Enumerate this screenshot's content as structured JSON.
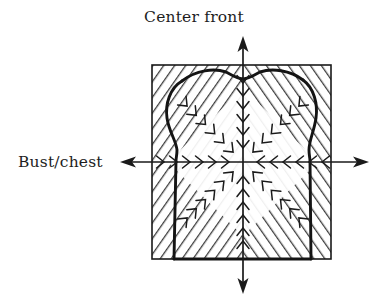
{
  "figure": {
    "type": "technical-illustration",
    "background_color": "#ffffff",
    "ink_color": "#1a1a1a",
    "hatch_color": "#4a4a4a",
    "labels": {
      "vertical_axis": "Center front",
      "horizontal_axis": "Bust/chest"
    },
    "axes": {
      "vertical": {
        "name": "Center front",
        "orientation": "vertical",
        "x": 243,
        "y_top": 38,
        "y_bottom": 292,
        "arrowheads": [
          "up",
          "down"
        ]
      },
      "horizontal": {
        "name": "Bust/chest",
        "orientation": "horizontal",
        "y": 162,
        "x_left": 122,
        "x_right": 367,
        "arrowheads": [
          "left",
          "right"
        ]
      },
      "origin": {
        "x": 243,
        "y": 162
      }
    },
    "square": {
      "name": "grading-square",
      "left": 152,
      "top": 65,
      "right": 331,
      "bottom": 259,
      "fill": "diagonal-hatch",
      "stroke": "#1a1a1a"
    },
    "bodice": {
      "name": "bodice-outline",
      "features": [
        "neckline-dip-at-center-front",
        "left-shoulder-point",
        "right-shoulder-point",
        "left-armhole-curve",
        "right-armhole-curve",
        "left-side-seam",
        "right-side-seam",
        "hem-at-square-bottom"
      ],
      "neckline_center": {
        "x": 243,
        "y": 79
      },
      "left_shoulder": {
        "x": 182,
        "y": 81
      },
      "right_shoulder": {
        "x": 303,
        "y": 80
      },
      "left_underarm": {
        "x": 176,
        "y": 160
      },
      "right_underarm": {
        "x": 310,
        "y": 160
      }
    },
    "convergence_marks": {
      "name": "inward-chevrons",
      "description": "short chevron strokes converging toward the centre point along the axes and diagonals",
      "count_per_direction": 6,
      "directions": [
        "up",
        "down",
        "left",
        "right",
        "up-left",
        "up-right",
        "down-left",
        "down-right"
      ]
    }
  }
}
